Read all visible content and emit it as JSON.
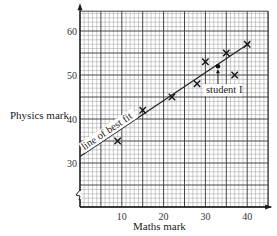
{
  "chart_data": {
    "type": "scatter",
    "title": "",
    "xlabel": "Maths mark",
    "ylabel": "Physics mark",
    "xlim": [
      0,
      45
    ],
    "ylim": [
      20,
      64.5
    ],
    "x_ticks": [
      10,
      20,
      30,
      40
    ],
    "y_ticks": [
      30,
      40,
      50,
      60
    ],
    "grid": true,
    "grid_minor_step": 1,
    "grid_major_step": 5,
    "y_axis_broken": true,
    "series": [
      {
        "name": "students",
        "marker": "x",
        "points": [
          {
            "x": 9,
            "y": 35
          },
          {
            "x": 15,
            "y": 42
          },
          {
            "x": 22,
            "y": 45
          },
          {
            "x": 28,
            "y": 48
          },
          {
            "x": 30,
            "y": 53
          },
          {
            "x": 35,
            "y": 55
          },
          {
            "x": 37,
            "y": 50
          },
          {
            "x": 40,
            "y": 57
          }
        ]
      },
      {
        "name": "student I",
        "marker": "dot",
        "points": [
          {
            "x": 33,
            "y": 52
          }
        ]
      }
    ],
    "line_of_best_fit": {
      "x1": 0,
      "y1": 31.5,
      "x2": 40.5,
      "y2": 57.2
    },
    "annotations": [
      {
        "text": "line of best fit",
        "target": "line_of_best_fit"
      },
      {
        "text": "student I",
        "x": 33,
        "y": 52,
        "arrow": true
      }
    ]
  },
  "labels": {
    "xlabel": "Maths mark",
    "ylabel": "Physics mark",
    "line_label": "line of best fit",
    "student_label": "student I"
  },
  "colors": {
    "minor_grid": "#9a9a9a",
    "major_grid": "#333333",
    "axis": "#1a1a1a",
    "marker": "#111111",
    "line": "#222222"
  }
}
